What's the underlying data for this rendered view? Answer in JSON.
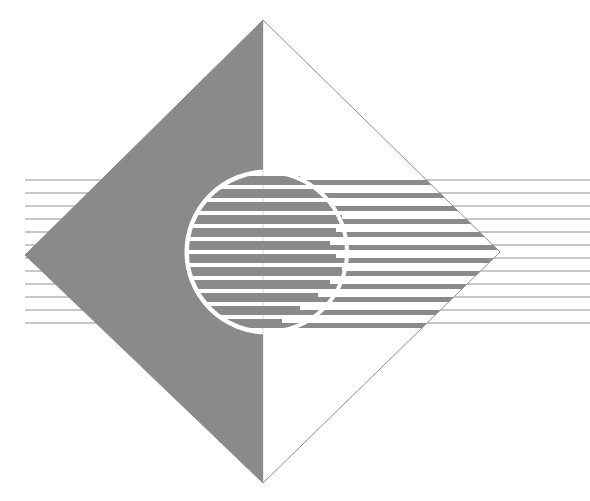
{
  "canvas": {
    "width": 590,
    "height": 501,
    "background": "#ffffff",
    "title": "abstract-geometric-logo"
  },
  "palette": {
    "gray_fill": "#8a8a8a",
    "white": "#ffffff",
    "hairline": "#8f8f8f",
    "outline": "#8f8f8f"
  },
  "figure": {
    "name": "diamond-circle-stripes-emblem"
  },
  "diamond": {
    "name": "diamond-outline",
    "vertices": [
      {
        "label": "top",
        "x": 263,
        "y": 20
      },
      {
        "label": "right",
        "x": 500,
        "y": 252
      },
      {
        "label": "bottom",
        "x": 263,
        "y": 483
      },
      {
        "label": "left",
        "x": 25,
        "y": 255
      }
    ],
    "left_half_fill": "#8a8a8a",
    "right_half_fill": "#ffffff",
    "stroke": "#8f8f8f",
    "stroke_width": 1,
    "split_axis_x": 263
  },
  "circle": {
    "name": "striped-circle",
    "center_x": 267,
    "center_y": 252,
    "radius": 80,
    "outline_color": "#ffffff",
    "outline_width": 4,
    "fill": "#8a8a8a"
  },
  "stripes": {
    "count": 12,
    "band_color": "#8a8a8a",
    "gap_color": "#ffffff",
    "band_height": 9,
    "gap_height": 4,
    "first_band_top": 176,
    "pitch": 13,
    "step_note": "each band terminates at a stepped x then resumes as a thinner band",
    "bands": [
      {
        "index": 0,
        "top": 176,
        "height": 9,
        "step_x": 300,
        "full_right": 470
      },
      {
        "index": 1,
        "top": 189,
        "height": 9,
        "step_x": 318,
        "full_right": 478
      },
      {
        "index": 2,
        "top": 202,
        "height": 9,
        "step_x": 330,
        "full_right": 487
      },
      {
        "index": 3,
        "top": 215,
        "height": 9,
        "step_x": 342,
        "full_right": 493
      },
      {
        "index": 4,
        "top": 228,
        "height": 9,
        "step_x": 336,
        "full_right": 499
      },
      {
        "index": 5,
        "top": 241,
        "height": 9,
        "step_x": 330,
        "full_right": 500
      },
      {
        "index": 6,
        "top": 254,
        "height": 9,
        "step_x": 336,
        "full_right": 498
      },
      {
        "index": 7,
        "top": 267,
        "height": 9,
        "step_x": 342,
        "full_right": 491
      },
      {
        "index": 8,
        "top": 280,
        "height": 9,
        "step_x": 330,
        "full_right": 484
      },
      {
        "index": 9,
        "top": 293,
        "height": 9,
        "step_x": 318,
        "full_right": 476
      },
      {
        "index": 10,
        "top": 306,
        "height": 9,
        "step_x": 300,
        "full_right": 468
      },
      {
        "index": 11,
        "top": 319,
        "height": 9,
        "step_x": 282,
        "full_right": 459
      }
    ]
  },
  "hairlines": {
    "name": "extending-hairlines",
    "count": 11,
    "color": "#8f8f8f",
    "width": 1,
    "right_edge_x": 590,
    "y_values": [
      180,
      193,
      206,
      219,
      232,
      245,
      258,
      271,
      284,
      297,
      310,
      323
    ]
  },
  "accessibility": {
    "alt": "Abstract emblem: gray diamond with a striped circle and horizontal lines radiating to the right"
  }
}
